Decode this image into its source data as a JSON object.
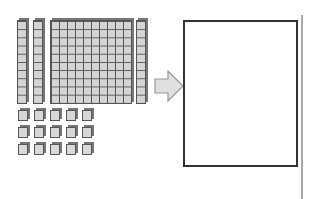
{
  "diagram": {
    "blocks": {
      "tens_rods_left": 2,
      "hundreds_flats": 1,
      "tens_rods_right": 1,
      "unit_cubes": 15,
      "unit_cube_grid": {
        "rows": 3,
        "cols": 5
      }
    },
    "arrow": {
      "direction": "right",
      "color": "#e0e0e0",
      "stroke": "#999999"
    },
    "answer_box": {
      "content": ""
    },
    "colors": {
      "block_fill": "#d4d4d4",
      "block_stroke": "#555555",
      "box_border": "#333333",
      "divider": "#aaaaaa"
    }
  }
}
